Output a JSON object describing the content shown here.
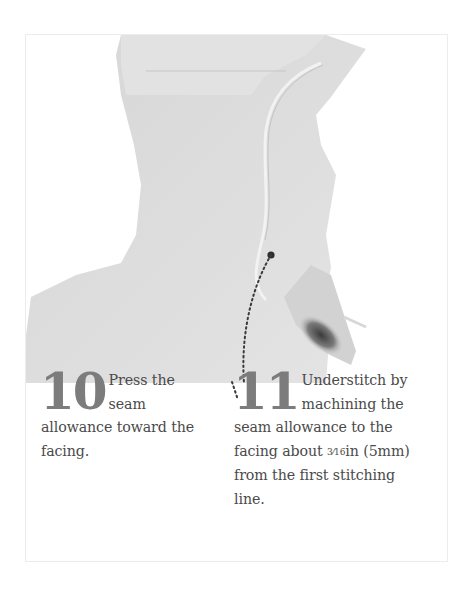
{
  "page": {
    "image": {
      "alt": "Photo of garment armhole with seam allowance pressed toward the facing, with a dotted leader line pointing to the understitching",
      "icon": "garment-photo"
    },
    "steps": [
      {
        "number": "10",
        "text_lead": "Press the seam",
        "text_rest": "allowance toward the facing."
      },
      {
        "number": "11",
        "text_lead": "Understitch by machining the",
        "text_mid": "seam allowance to the facing about",
        "fraction": "3⁄16",
        "text_unit": "in (5mm) from the first stitching line."
      }
    ],
    "colors": {
      "step_number": "#7c7c7c",
      "body_text": "#4a4a4a",
      "fabric": "#dcdcdc",
      "frame_border": "#ececec"
    }
  }
}
